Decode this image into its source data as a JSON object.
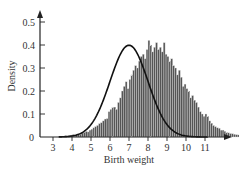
{
  "chart_data": {
    "type": "bar",
    "subtype": "histogram-with-density-curve",
    "title": "",
    "xlabel": "Birth weight",
    "ylabel": "Density",
    "xlim": [
      2.3,
      11.8
    ],
    "ylim": [
      0,
      0.55
    ],
    "x_ticks": [
      3,
      4,
      5,
      6,
      7,
      8,
      9,
      10,
      11
    ],
    "x_tick_labels": [
      "3",
      "4",
      "5",
      "6",
      "7",
      "8",
      "9",
      "10",
      "11"
    ],
    "y_ticks": [
      0,
      0.1,
      0.2,
      0.3,
      0.4,
      0.5
    ],
    "y_tick_labels": [
      "0",
      "0.1",
      "0.2",
      "0.3",
      "0.4",
      "0.5"
    ],
    "grid": false,
    "legend": null,
    "bin_width": 0.1,
    "bin_start": 3.6,
    "bins": [
      0.005,
      0.004,
      0.006,
      0.008,
      0.01,
      0.009,
      0.013,
      0.014,
      0.012,
      0.017,
      0.02,
      0.024,
      0.022,
      0.03,
      0.034,
      0.04,
      0.045,
      0.05,
      0.058,
      0.062,
      0.07,
      0.078,
      0.08,
      0.11,
      0.12,
      0.13,
      0.13,
      0.12,
      0.15,
      0.17,
      0.2,
      0.22,
      0.24,
      0.21,
      0.25,
      0.27,
      0.29,
      0.31,
      0.3,
      0.33,
      0.35,
      0.36,
      0.34,
      0.38,
      0.42,
      0.4,
      0.37,
      0.39,
      0.41,
      0.38,
      0.39,
      0.37,
      0.41,
      0.36,
      0.35,
      0.33,
      0.34,
      0.31,
      0.3,
      0.27,
      0.29,
      0.26,
      0.22,
      0.23,
      0.21,
      0.2,
      0.17,
      0.18,
      0.16,
      0.15,
      0.13,
      0.11,
      0.1,
      0.09,
      0.1,
      0.09,
      0.07,
      0.06,
      0.05,
      0.045,
      0.04,
      0.038,
      0.03,
      0.03,
      0.025,
      0.02,
      0.018,
      0.015,
      0.014,
      0.012,
      0.01,
      0.009,
      0.008,
      0.006,
      0.005,
      0.005,
      0.004,
      0.003,
      0.003,
      0.002
    ],
    "density_curve": {
      "distribution": "normal",
      "mean": 7.0,
      "sd": 1.0,
      "peak": 0.399
    },
    "bar_color": "#555555",
    "bar_edge_color": "#dddddd",
    "curve_color": "#111111",
    "axis_color": "#222222"
  }
}
